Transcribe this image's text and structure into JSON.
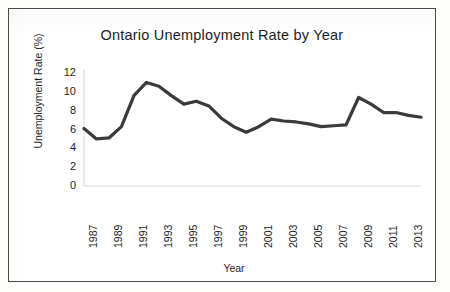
{
  "document": {
    "kind": "scanned-chart-figure",
    "border_color": "#4a4a4a",
    "background": "#ffffff"
  },
  "chart_data": {
    "type": "line",
    "title": "Ontario Unemployment Rate by Year",
    "xlabel": "Year",
    "ylabel": "Unemployment Rate (%)",
    "x": [
      1987,
      1988,
      1989,
      1990,
      1991,
      1992,
      1993,
      1994,
      1995,
      1996,
      1997,
      1998,
      1999,
      2000,
      2001,
      2002,
      2003,
      2004,
      2005,
      2006,
      2007,
      2008,
      2009,
      2010,
      2011,
      2012,
      2013,
      2014
    ],
    "values": [
      6.1,
      5.0,
      5.1,
      6.3,
      9.6,
      11.0,
      10.6,
      9.6,
      8.7,
      9.0,
      8.5,
      7.2,
      6.3,
      5.7,
      6.3,
      7.1,
      6.9,
      6.8,
      6.6,
      6.3,
      6.4,
      6.5,
      9.4,
      8.7,
      7.8,
      7.8,
      7.5,
      7.3
    ],
    "series": [
      {
        "name": "Unemployment Rate (%)",
        "color": "#3a3a3a",
        "values": [
          6.1,
          5.0,
          5.1,
          6.3,
          9.6,
          11.0,
          10.6,
          9.6,
          8.7,
          9.0,
          8.5,
          7.2,
          6.3,
          5.7,
          6.3,
          7.1,
          6.9,
          6.8,
          6.6,
          6.3,
          6.4,
          6.5,
          9.4,
          8.7,
          7.8,
          7.8,
          7.5,
          7.3
        ]
      }
    ],
    "ylim": [
      0,
      12
    ],
    "yticks": [
      0,
      2,
      4,
      6,
      8,
      10,
      12
    ],
    "ytick_labels": [
      "0",
      "2",
      "4",
      "6",
      "8",
      "10",
      "12"
    ],
    "xticks": [
      1987,
      1989,
      1991,
      1993,
      1995,
      1997,
      1999,
      2001,
      2003,
      2005,
      2007,
      2009,
      2011,
      2013
    ],
    "xtick_labels": [
      "1987",
      "1989",
      "1991",
      "1993",
      "1995",
      "1997",
      "1999",
      "2001",
      "2003",
      "2005",
      "2007",
      "2009",
      "2011",
      "2013"
    ],
    "xlim": [
      1987,
      2014
    ],
    "grid": false,
    "legend": null,
    "legend_position": "none",
    "line_width_px": 3.2,
    "marker": "none",
    "axis_color": "#d9d9d9"
  }
}
